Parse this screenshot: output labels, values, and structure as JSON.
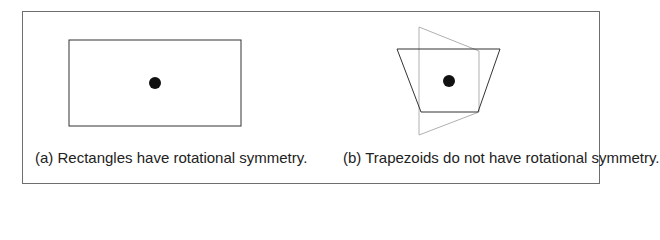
{
  "figure": {
    "panel_a": {
      "caption": "(a) Rectangles have rotational symmetry.",
      "shape": "rectangle",
      "rect": {
        "x": 69,
        "y": 40,
        "width": 172,
        "height": 86
      },
      "center_dot": {
        "cx": 155,
        "cy": 83,
        "r": 6
      }
    },
    "panel_b": {
      "caption": "(b) Trapezoids do not have rotational symmetry.",
      "shape": "trapezoid",
      "trapezoid_points": "397,49 500,49 478,112 421,112",
      "rotated_trapezoid_points": "419,27 479,51 479,112 419,135",
      "center_dot": {
        "cx": 449,
        "cy": 81,
        "r": 6
      }
    },
    "colors": {
      "frame": "#6e6e6e",
      "shape_stroke": "#333333",
      "rotated_stroke": "#b0b0b0",
      "dot": "#111111"
    }
  }
}
